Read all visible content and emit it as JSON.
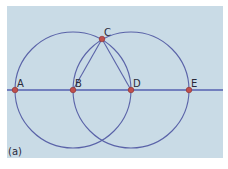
{
  "figure": {
    "caption": "(a)",
    "colors": {
      "background": "#c9dbe6",
      "line": "#5560b0",
      "circle": "#5a63a8",
      "point_fill": "#c0504d",
      "point_stroke": "#8a2e2e",
      "label": "#2a2a3a"
    },
    "points": [
      {
        "label": "A",
        "x": 15,
        "y": 90
      },
      {
        "label": "B",
        "x": 73,
        "y": 90
      },
      {
        "label": "C",
        "x": 102,
        "y": 39
      },
      {
        "label": "D",
        "x": 131,
        "y": 90
      },
      {
        "label": "E",
        "x": 189,
        "y": 90
      }
    ],
    "circles": [
      {
        "center": "B",
        "radius": 58
      },
      {
        "center": "D",
        "radius": 58
      }
    ],
    "segments": [
      [
        "B",
        "C"
      ],
      [
        "C",
        "D"
      ]
    ],
    "line": {
      "through": [
        "A",
        "E"
      ],
      "y": 90
    }
  }
}
